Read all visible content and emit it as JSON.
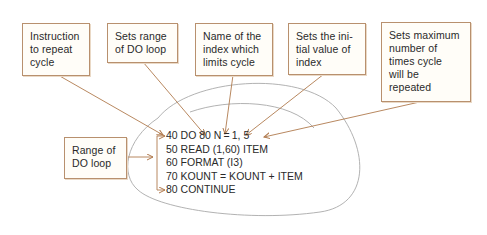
{
  "diagram": {
    "title": "",
    "colors": {
      "arrow": "#b07a4e",
      "box_border": "#b8906e",
      "loop_outline": "#a9a9a9",
      "text": "#2a2a2a"
    },
    "annotations": [
      {
        "id": "instruction",
        "lines": [
          "Instruction",
          "to repeat",
          "cycle"
        ]
      },
      {
        "id": "range",
        "lines": [
          "Sets range",
          "of DO loop"
        ]
      },
      {
        "id": "index_name",
        "lines": [
          "Name of the",
          "index which",
          "limits cycle"
        ]
      },
      {
        "id": "initial",
        "lines": [
          "Sets the ini-",
          "tial value of",
          "index"
        ]
      },
      {
        "id": "maximum",
        "lines": [
          "Sets maximum",
          "number of",
          "times cycle",
          "will be",
          "repeated"
        ]
      },
      {
        "id": "loop_range",
        "lines": [
          "Range of",
          "DO loop"
        ]
      }
    ],
    "code_lines": [
      "40 DO 80 N = 1, 5",
      "50 READ (1,60) ITEM",
      "60 FORMAT (I3)",
      "70 KOUNT  =  KOUNT  +  ITEM",
      "80 CONTINUE"
    ]
  }
}
